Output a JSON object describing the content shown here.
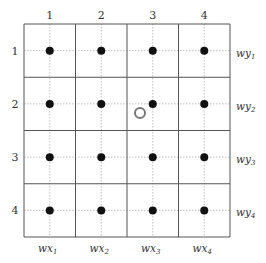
{
  "diagram": {
    "grid": {
      "rows": 4,
      "cols": 4,
      "x0": 24,
      "y0": 24,
      "x1": 230,
      "y1": 237,
      "border_color": "#555555",
      "dotted_color": "#b0b0b0"
    },
    "column_labels": [
      "1",
      "2",
      "3",
      "4"
    ],
    "row_labels": [
      "1",
      "2",
      "3",
      "4"
    ],
    "bottom_labels": [
      {
        "base": "wx",
        "sub": "1"
      },
      {
        "base": "wx",
        "sub": "2"
      },
      {
        "base": "wx",
        "sub": "3"
      },
      {
        "base": "wx",
        "sub": "4"
      }
    ],
    "right_labels": [
      {
        "base": "wy",
        "sub": "1"
      },
      {
        "base": "wy",
        "sub": "2"
      },
      {
        "base": "wy",
        "sub": "3"
      },
      {
        "base": "wy",
        "sub": "4"
      }
    ],
    "dot_color": "#111111",
    "filled_points": [
      {
        "row": 1,
        "col": 1
      },
      {
        "row": 1,
        "col": 2
      },
      {
        "row": 1,
        "col": 3
      },
      {
        "row": 1,
        "col": 4
      },
      {
        "row": 2,
        "col": 1
      },
      {
        "row": 2,
        "col": 2
      },
      {
        "row": 2,
        "col": 3
      },
      {
        "row": 2,
        "col": 4
      },
      {
        "row": 3,
        "col": 1
      },
      {
        "row": 3,
        "col": 2
      },
      {
        "row": 3,
        "col": 3
      },
      {
        "row": 3,
        "col": 4
      },
      {
        "row": 4,
        "col": 1
      },
      {
        "row": 4,
        "col": 2
      },
      {
        "row": 4,
        "col": 3
      },
      {
        "row": 4,
        "col": 4
      }
    ],
    "open_point": {
      "x": 140,
      "y": 113,
      "r": 5,
      "color": "#777777"
    }
  }
}
